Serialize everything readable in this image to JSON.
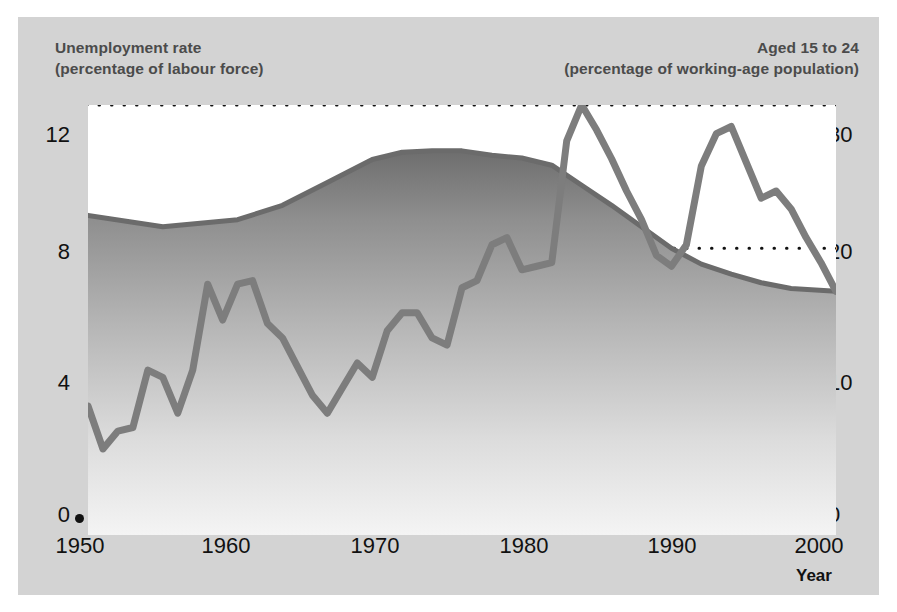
{
  "figure": {
    "panel_bg": "#d3d3d3",
    "plot_bg": "#ffffff",
    "header_color": "#4b4b4b",
    "line_color": "#7d7d7d",
    "area_top_color": "#6e6e6e",
    "area_bottom_color": "#f2f2f2"
  },
  "header": {
    "left_line1": "Unemployment rate",
    "left_line2": "(percentage of labour force)",
    "right_line1": "Aged 15 to 24",
    "right_line2": "(percentage of working-age population)"
  },
  "axis": {
    "x_title": "Year",
    "left_ticks": [
      "0",
      "4",
      "8",
      "12"
    ],
    "right_ticks": [
      "0",
      "10",
      "20",
      "30"
    ],
    "x_ticks": [
      "1950",
      "1960",
      "1970",
      "1980",
      "1990",
      "2000"
    ]
  },
  "chart_data": {
    "type": "line",
    "xlabel": "Year",
    "ylabel": "Unemployment rate (percentage of labour force)",
    "y2label": "Aged 15 to 24 (percentage of working-age population)",
    "xlim": [
      1950,
      2000
    ],
    "ylim": [
      0,
      12
    ],
    "y2lim": [
      0,
      30
    ],
    "grid": true,
    "grid_style": "dotted",
    "legend_position": "none",
    "x_tick_values": [
      1950,
      1960,
      1970,
      1980,
      1990,
      2000
    ],
    "y_tick_values": [
      0,
      4,
      8,
      12
    ],
    "y2_tick_values": [
      0,
      10,
      20,
      30
    ],
    "series": [
      {
        "name": "Unemployment rate",
        "axis": "left",
        "units": "percentage of labour force",
        "render": "line",
        "x": [
          1950,
          1951,
          1952,
          1953,
          1954,
          1955,
          1956,
          1957,
          1958,
          1959,
          1960,
          1961,
          1962,
          1963,
          1964,
          1965,
          1966,
          1967,
          1968,
          1969,
          1970,
          1971,
          1972,
          1973,
          1974,
          1975,
          1976,
          1977,
          1978,
          1979,
          1980,
          1981,
          1982,
          1983,
          1984,
          1985,
          1986,
          1987,
          1988,
          1989,
          1990,
          1991,
          1992,
          1993,
          1994,
          1995,
          1996,
          1997,
          1998,
          1999,
          2000
        ],
        "values": [
          3.6,
          2.4,
          2.9,
          3.0,
          4.6,
          4.4,
          3.4,
          4.6,
          7.0,
          6.0,
          7.0,
          7.1,
          5.9,
          5.5,
          4.7,
          3.9,
          3.4,
          4.1,
          4.8,
          4.4,
          5.7,
          6.2,
          6.2,
          5.5,
          5.3,
          6.9,
          7.1,
          8.1,
          8.3,
          7.4,
          7.5,
          7.6,
          11.0,
          12.0,
          11.3,
          10.5,
          9.6,
          8.8,
          7.8,
          7.5,
          8.1,
          10.3,
          11.2,
          11.4,
          10.4,
          9.4,
          9.6,
          9.1,
          8.3,
          7.6,
          6.8
        ]
      },
      {
        "name": "Aged 15 to 24",
        "axis": "right",
        "units": "percentage of working-age population",
        "render": "area",
        "x": [
          1950,
          1955,
          1960,
          1963,
          1966,
          1969,
          1971,
          1973,
          1975,
          1977,
          1979,
          1981,
          1983,
          1985,
          1987,
          1989,
          1991,
          1993,
          1995,
          1997,
          2000
        ],
        "values": [
          22.3,
          21.5,
          22.0,
          23.0,
          24.6,
          26.2,
          26.7,
          26.8,
          26.8,
          26.5,
          26.3,
          25.8,
          24.4,
          23.0,
          21.5,
          20.0,
          18.9,
          18.2,
          17.6,
          17.2,
          17.0
        ]
      }
    ],
    "annotations": [
      {
        "text": "Sharp rise in unemployment 1981-1983 peaking at 12",
        "x": 1983,
        "y": 12
      },
      {
        "text": "Second peak 1993 at 11.4",
        "x": 1993,
        "y": 11.4
      },
      {
        "text": "Youth share of working-age population peaks mid-1970s near 27",
        "x": 1974,
        "y2": 26.8
      }
    ]
  }
}
